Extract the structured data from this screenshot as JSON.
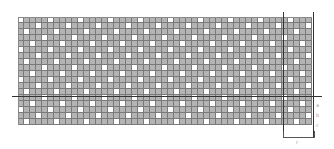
{
  "diagram": {
    "type": "weave-pattern-grid",
    "grid": {
      "columns": 49,
      "rows": 18,
      "cell_px": 6,
      "fill_color": "#b4b4b4",
      "line_color": "#7a7a7a",
      "open_color": "#ffffff"
    },
    "pattern": {
      "repeat": 5,
      "step": 2
    },
    "axis_lines": {
      "horizontal_y": 96,
      "vertical_x": [
        283,
        313
      ]
    },
    "bracket": {
      "x_start": 283,
      "x_end": 313,
      "label": "r"
    },
    "side_labels": [
      "a",
      "b",
      "c"
    ]
  }
}
